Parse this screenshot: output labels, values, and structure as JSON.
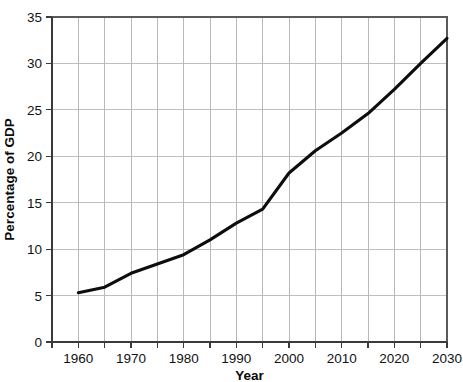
{
  "chart_data": {
    "type": "line",
    "title": "",
    "xlabel": "Year",
    "ylabel": "Percentage of GDP",
    "xlim": [
      1955,
      2030
    ],
    "ylim": [
      0,
      35
    ],
    "grid": true,
    "legend": "none",
    "x_ticks": [
      1960,
      1970,
      1980,
      1990,
      2000,
      2010,
      2020,
      2030
    ],
    "x_tick_labels": [
      "1960",
      "1970",
      "1980",
      "1990",
      "2000",
      "2010",
      "2020",
      "2030"
    ],
    "x_minor_ticks": [
      1955,
      1965,
      1975,
      1985,
      1995,
      2005,
      2015,
      2025
    ],
    "y_ticks": [
      0,
      5,
      10,
      15,
      20,
      25,
      30,
      35
    ],
    "y_tick_labels": [
      "0",
      "5",
      "10",
      "15",
      "20",
      "25",
      "30",
      "35"
    ],
    "series": [
      {
        "name": "Percentage of GDP",
        "color": "#0d0d0d",
        "x": [
          1960,
          1965,
          1970,
          1975,
          1980,
          1985,
          1990,
          1995,
          2000,
          2005,
          2010,
          2015,
          2020,
          2025,
          2030
        ],
        "values": [
          5.3,
          5.9,
          7.4,
          8.4,
          9.4,
          11.0,
          12.8,
          14.3,
          18.2,
          20.6,
          22.5,
          24.6,
          27.2,
          30.0,
          32.7
        ]
      }
    ]
  },
  "axes": {
    "y_title": "Percentage of GDP",
    "x_title": "Year"
  }
}
